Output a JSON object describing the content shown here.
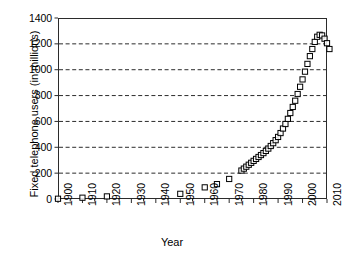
{
  "chart_data": {
    "type": "scatter",
    "title": "",
    "xlabel": "Year",
    "ylabel": "Fixed telephone users (in millions)",
    "xlim": [
      1900,
      2010
    ],
    "ylim": [
      0,
      1400
    ],
    "xticks": [
      1900,
      1910,
      1920,
      1930,
      1940,
      1950,
      1960,
      1970,
      1980,
      1990,
      2000,
      2010
    ],
    "xtick_labels": [
      "1900",
      "1910",
      "1920",
      "1930",
      "1940",
      "1950",
      "1960",
      "1970",
      "1980",
      "1990",
      "2000",
      "2010"
    ],
    "yticks": [
      0,
      200,
      400,
      600,
      800,
      1000,
      1200,
      1400
    ],
    "ytick_labels": [
      "0",
      "200",
      "400",
      "600",
      "800",
      "1000",
      "1200",
      "1400"
    ],
    "grid": "horizontal-dashed",
    "legend": "none",
    "marker": "open-square",
    "marker_color": "#000000",
    "line": "none",
    "series": [
      {
        "name": "Fixed telephone users",
        "x": [
          1900,
          1910,
          1920,
          1950,
          1960,
          1965,
          1970,
          1975,
          1976,
          1977,
          1978,
          1979,
          1980,
          1981,
          1982,
          1983,
          1984,
          1985,
          1986,
          1987,
          1988,
          1989,
          1990,
          1991,
          1992,
          1993,
          1994,
          1995,
          1996,
          1997,
          1998,
          1999,
          2000,
          2001,
          2002,
          2003,
          2004,
          2005,
          2006,
          2007,
          2008,
          2009,
          2010,
          2011
        ],
        "y": [
          2,
          10,
          20,
          40,
          90,
          115,
          155,
          220,
          235,
          250,
          265,
          280,
          295,
          310,
          325,
          340,
          355,
          372,
          390,
          410,
          432,
          455,
          480,
          510,
          545,
          580,
          620,
          665,
          712,
          760,
          812,
          868,
          925,
          985,
          1045,
          1105,
          1160,
          1215,
          1255,
          1270,
          1265,
          1240,
          1205,
          1160
        ]
      }
    ],
    "peak": {
      "year": 2007,
      "value": 1270
    }
  },
  "axis": {
    "x_title": "Year",
    "y_title": "Fixed telephone users (in millions)"
  }
}
